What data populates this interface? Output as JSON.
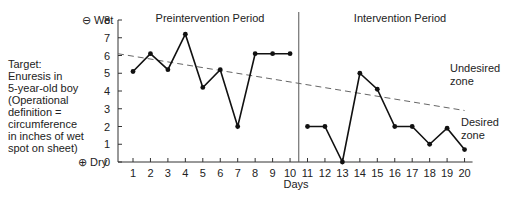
{
  "chart_data": {
    "type": "line",
    "title": "",
    "xlabel": "Days",
    "ylabel": "Target: Enuresis in 5-year-old boy (Operational definition = circumference in inches of wet spot on sheet)",
    "ylim": [
      0,
      8
    ],
    "xlim": [
      1,
      20
    ],
    "y_ticks": [
      0,
      1,
      2,
      3,
      4,
      5,
      6,
      7,
      8
    ],
    "x_ticks": [
      1,
      2,
      3,
      4,
      5,
      6,
      7,
      8,
      9,
      10,
      11,
      12,
      13,
      14,
      15,
      16,
      17,
      18,
      19,
      20
    ],
    "y_top_label": "⊖ Wet",
    "y_bottom_label": "⊕ Dry",
    "phases": [
      {
        "name": "Preintervention Period",
        "x": [
          1,
          2,
          3,
          4,
          5,
          6,
          7,
          8,
          9,
          10
        ],
        "values": [
          5.1,
          6.1,
          5.2,
          7.2,
          4.2,
          5.2,
          2.0,
          6.1,
          6.1,
          6.1
        ]
      },
      {
        "name": "Intervention Period",
        "x": [
          11,
          12,
          13,
          14,
          15,
          16,
          17,
          18,
          19,
          20
        ],
        "values": [
          2.0,
          2.0,
          0.0,
          5.0,
          4.1,
          2.0,
          2.0,
          1.0,
          1.9,
          0.7
        ]
      }
    ],
    "phase_divider_x": 10.5,
    "trend_line": {
      "style": "dashed",
      "start": {
        "x": 0,
        "y": 6.1
      },
      "end": {
        "x": 20,
        "y": 2.9
      }
    },
    "annotations": [
      {
        "text": "Undesired zone",
        "position": "above trend line, right"
      },
      {
        "text": "Desired zone",
        "position": "below trend line, right"
      }
    ],
    "grid": false,
    "legend": null
  },
  "labels": {
    "target": "Target:\nEnuresis in\n5-year-old boy\n(Operational\ndefinition =\ncircumference\nin inches of wet\nspot on sheet)",
    "wet": "⊖ Wet",
    "dry": "⊕ Dry",
    "pre_period": "Preintervention Period",
    "int_period": "Intervention Period",
    "undesired": "Undesired\nzone",
    "desired": "Desired\nzone",
    "days": "Days"
  }
}
